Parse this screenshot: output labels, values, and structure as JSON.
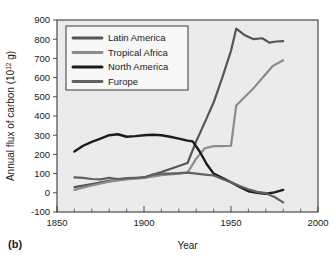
{
  "panel": {
    "label": "(b)"
  },
  "chart_data": {
    "type": "line",
    "title": "",
    "xlabel": "Year",
    "ylabel": "Annual flux of carbon (10¹² g)",
    "ylabel_base": "Annual flux of carbon (10",
    "ylabel_sup": "12",
    "ylabel_tail": " g)",
    "xlim": [
      1850,
      2000
    ],
    "ylim": [
      -100,
      900
    ],
    "xticks": [
      1850,
      1900,
      1950,
      2000
    ],
    "xtick_labels": [
      "1850",
      "1900",
      "1950",
      "2000"
    ],
    "xticks_minor_step": 10,
    "yticks": [
      -100,
      0,
      100,
      200,
      300,
      400,
      500,
      600,
      700,
      800,
      900
    ],
    "ytick_labels": [
      "-100",
      "0",
      "100",
      "200",
      "300",
      "400",
      "500",
      "600",
      "700",
      "800",
      "900"
    ],
    "grid": false,
    "legend_position": "upper-left",
    "series": [
      {
        "name": "Latin America",
        "color": "#555555",
        "width": 2.2,
        "x": [
          1860,
          1870,
          1880,
          1890,
          1900,
          1910,
          1920,
          1925,
          1930,
          1935,
          1940,
          1945,
          1950,
          1953,
          1958,
          1963,
          1968,
          1972,
          1976,
          1980
        ],
        "y": [
          30,
          45,
          62,
          72,
          80,
          108,
          140,
          155,
          268,
          368,
          470,
          600,
          740,
          855,
          820,
          800,
          805,
          782,
          788,
          790
        ]
      },
      {
        "name": "Tropical Africa",
        "color": "#8c8c8c",
        "width": 2.2,
        "x": [
          1860,
          1870,
          1880,
          1890,
          1900,
          1910,
          1920,
          1925,
          1930,
          1935,
          1940,
          1945,
          1950,
          1953,
          1958,
          1963,
          1968,
          1974,
          1980
        ],
        "y": [
          15,
          38,
          58,
          70,
          78,
          92,
          100,
          105,
          178,
          232,
          243,
          243,
          245,
          455,
          500,
          545,
          598,
          660,
          690
        ]
      },
      {
        "name": "North America",
        "color": "#1c1c1c",
        "width": 2.4,
        "x": [
          1860,
          1865,
          1870,
          1875,
          1880,
          1885,
          1890,
          1895,
          1900,
          1905,
          1910,
          1915,
          1920,
          1925,
          1928,
          1932,
          1936,
          1940,
          1945,
          1950,
          1955,
          1960,
          1965,
          1970,
          1975,
          1980
        ],
        "y": [
          215,
          245,
          265,
          282,
          300,
          305,
          292,
          295,
          300,
          302,
          300,
          292,
          282,
          272,
          268,
          215,
          150,
          100,
          78,
          55,
          30,
          8,
          0,
          -5,
          2,
          15
        ]
      },
      {
        "name": "Furope",
        "color": "#606060",
        "width": 2.2,
        "x": [
          1860,
          1865,
          1870,
          1875,
          1880,
          1885,
          1890,
          1895,
          1900,
          1905,
          1910,
          1915,
          1920,
          1925,
          1930,
          1935,
          1940,
          1945,
          1950,
          1955,
          1960,
          1965,
          1970,
          1975,
          1980
        ],
        "y": [
          80,
          78,
          72,
          70,
          78,
          72,
          76,
          78,
          80,
          95,
          100,
          100,
          102,
          105,
          100,
          95,
          90,
          72,
          55,
          35,
          18,
          5,
          -2,
          -22,
          -50
        ]
      }
    ]
  },
  "legend": {
    "entries": [
      {
        "label": "Latin America"
      },
      {
        "label": "Tropical Africa"
      },
      {
        "label": "North America"
      },
      {
        "label": "Furope"
      }
    ]
  }
}
